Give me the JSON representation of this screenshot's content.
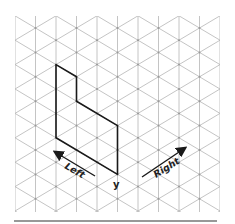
{
  "diagram": {
    "type": "isometric-grid-drawing",
    "grid": {
      "line_color": "#b5b5b5",
      "column_spacing": 20.5,
      "node_vertical_spacing": 24.4,
      "left": 15,
      "right": 220,
      "top": 16,
      "bottom": 212
    },
    "shape": {
      "stroke_color": "#1a1a1a",
      "points": [
        [
          56,
          64.6
        ],
        [
          76.5,
          76.8
        ],
        [
          76.5,
          101.2
        ],
        [
          117.5,
          125.6
        ],
        [
          117.5,
          174.4
        ],
        [
          56,
          137.8
        ]
      ]
    },
    "labels": {
      "left": "Left",
      "right": "Right",
      "vertex": "y"
    },
    "baseline": {
      "x1": 14,
      "x2": 217,
      "y": 221
    }
  }
}
